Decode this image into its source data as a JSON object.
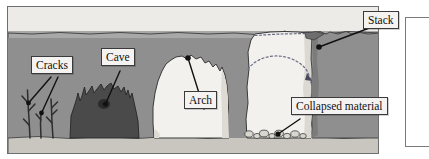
{
  "figure": {
    "type": "coastal-erosion-cross-section",
    "labels": [
      {
        "id": "cracks",
        "text": "Cracks"
      },
      {
        "id": "cave",
        "text": "Cave"
      },
      {
        "id": "arch",
        "text": "Arch"
      },
      {
        "id": "collapsed",
        "text": "Collapsed material"
      },
      {
        "id": "stack",
        "text": "Stack"
      }
    ],
    "colors": {
      "sky": "#ecebe8",
      "cliff_top": "#a8a8a8",
      "cliff_face": "#8f8f8f",
      "beach": "#c9c6bf",
      "arch_rock": "#f2f1ee",
      "stack_rock": "#f2f1ee",
      "cave_dark": "#4a4a4a",
      "outline": "#3a3a3a",
      "label_fill": "#f4f3f1",
      "frame_border": "#6e6e6e"
    },
    "annotations": {
      "former_cliff_line": "dotted line across stack top",
      "former_arch_line": "dotted arc through stack"
    }
  }
}
